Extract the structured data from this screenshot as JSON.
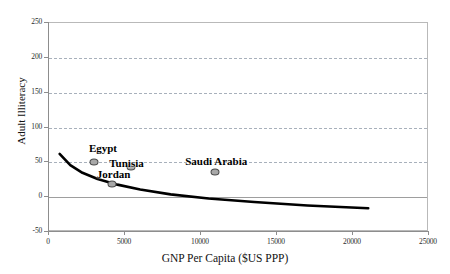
{
  "chart_data": {
    "type": "scatter",
    "title": "",
    "xlabel": "GNP Per Capita ($US PPP)",
    "ylabel": "Adult Illiteracy",
    "xlim": [
      0,
      25000
    ],
    "ylim": [
      -50,
      250
    ],
    "xticks": [
      0,
      5000,
      10000,
      15000,
      20000,
      25000
    ],
    "yticks": [
      -50,
      0,
      50,
      100,
      150,
      200,
      250
    ],
    "grid": "horizontal-dashed",
    "legend": "none",
    "points": [
      {
        "label": "Egypt",
        "x": 2950,
        "y": 50
      },
      {
        "label": "Tunisia",
        "x": 5400,
        "y": 43
      },
      {
        "label": "Jordan",
        "x": 4150,
        "y": 19
      },
      {
        "label": "Saudi Arabia",
        "x": 10900,
        "y": 36
      }
    ],
    "label_offsets": [
      {
        "label": "Egypt",
        "lx": 3550,
        "ly": 70
      },
      {
        "label": "Tunisia",
        "lx": 5100,
        "ly": 49
      },
      {
        "label": "Jordan",
        "lx": 4250,
        "ly": 33
      },
      {
        "label": "Saudi Arabia",
        "lx": 11000,
        "ly": 52
      }
    ],
    "trendline": {
      "name": "logarithmic fit",
      "x": [
        700,
        1400,
        2200,
        3200,
        4500,
        6000,
        8000,
        10500,
        13500,
        17000,
        21000
      ],
      "y": [
        62,
        46,
        35,
        26,
        18,
        11,
        4,
        -2,
        -7,
        -12,
        -16
      ]
    },
    "colors": {
      "marker_fill": "#a8a8a8",
      "marker_edge": "#4a4a4a",
      "trend": "#000000",
      "grid": "#9aa3b0",
      "axis": "#8d8d8d",
      "background": "#ffffff",
      "text": "#111111"
    }
  }
}
